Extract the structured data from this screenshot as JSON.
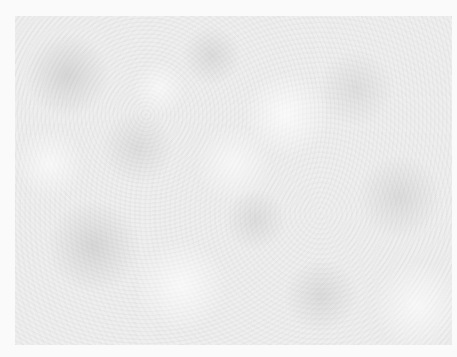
{
  "image": {
    "description": "Grayscale mottled noise texture (cloud/felt-like pattern) on a near-white background",
    "colors": {
      "background": "#fafafa",
      "panel_base": "#eeeeee",
      "mottle_dark": "#aaaaaa",
      "mottle_light": "#ffffff"
    },
    "panel_bounds": {
      "left": 15,
      "top": 16,
      "right": 452,
      "bottom": 345
    }
  }
}
